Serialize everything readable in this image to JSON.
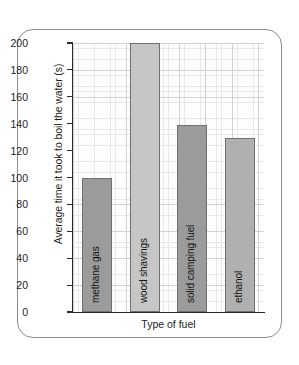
{
  "chart_data": {
    "type": "bar",
    "title": "",
    "xlabel": "Type of fuel",
    "ylabel": "Average time it took to boil the water (s)",
    "categories": [
      "methane gas",
      "wood shavings",
      "solid camping fuel",
      "ethanol"
    ],
    "values": [
      100,
      200,
      139,
      129
    ],
    "ylim": [
      0,
      200
    ],
    "ytick_labels": [
      "200",
      "180",
      "160",
      "140",
      "120",
      "100",
      "80",
      "60",
      "40",
      "20",
      "0"
    ],
    "ytick_values": [
      200,
      180,
      160,
      140,
      120,
      100,
      80,
      60,
      40,
      20,
      0
    ],
    "grid": true,
    "legend": "none",
    "bar_colors": [
      "#9b9b9b",
      "#c6c6c6",
      "#9b9b9b",
      "#b0b0b0"
    ],
    "bar_border_color": "#707070",
    "axis_color": "#2b2b2b",
    "grid_major_color": "#d2d2d2",
    "grid_minor_color": "#e8e8e8",
    "plot_background": "#fdfdfd",
    "frame_color": "#8d8d8d"
  }
}
